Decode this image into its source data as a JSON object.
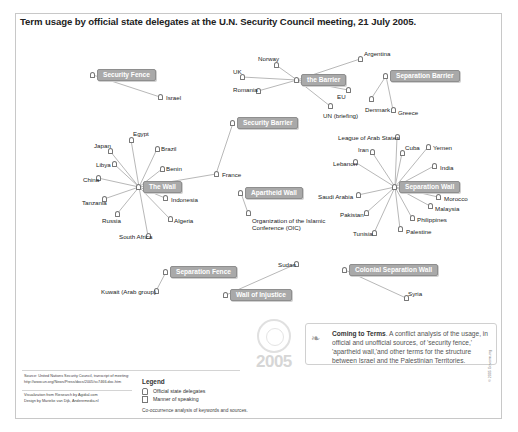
{
  "title": "Term usage by official state delegates at the U.N. Security Council meeting, 21 July 2005.",
  "chart_data": {
    "type": "network",
    "title": "Term usage by official state delegates at the U.N. Security Council meeting, 21 July 2005.",
    "terms": [
      {
        "term": "Security Fence",
        "delegates": [
          "Israel"
        ]
      },
      {
        "term": "the Barrier",
        "delegates": [
          "Norway",
          "UK",
          "Romania",
          "Argentina",
          "EU",
          "UN (briefing)"
        ]
      },
      {
        "term": "Separation Barrier",
        "delegates": [
          "Denmark",
          "Greece"
        ]
      },
      {
        "term": "Security Barrier",
        "delegates": [
          "France"
        ]
      },
      {
        "term": "The Wall",
        "delegates": [
          "Egypt",
          "Japan",
          "Brazil",
          "Libya",
          "Benin",
          "China",
          "France",
          "Tanzania",
          "Indonesia",
          "Russia",
          "Algeria",
          "South Africa"
        ]
      },
      {
        "term": "Apartheid Wall",
        "delegates": [
          "Organization of the Islamic Conference (OIC)"
        ]
      },
      {
        "term": "Separation Wall",
        "delegates": [
          "League of Arab States",
          "Iran",
          "Cuba",
          "Yemen",
          "Lebanon",
          "India",
          "Saudi Arabia",
          "Morocco",
          "Malaysia",
          "Pakistan",
          "Philippines",
          "Tunisia",
          "Palestine"
        ]
      },
      {
        "term": "Separation Fence",
        "delegates": [
          "Kuwait (Arab group)"
        ]
      },
      {
        "term": "Wall of Injustice",
        "delegates": [
          "Sudan"
        ]
      },
      {
        "term": "Colonial Separation Wall",
        "delegates": [
          "Syria"
        ]
      }
    ]
  },
  "hubs": [
    {
      "label": "Security Fence",
      "x": 97,
      "y": 69
    },
    {
      "label": "the Barrier",
      "x": 301,
      "y": 74
    },
    {
      "label": "Separation Barrier",
      "x": 390,
      "y": 70
    },
    {
      "label": "Security Barrier",
      "x": 237,
      "y": 117
    },
    {
      "label": "The Wall",
      "x": 143,
      "y": 181
    },
    {
      "label": "Apartheid Wall",
      "x": 245,
      "y": 187
    },
    {
      "label": "Separation Wall",
      "x": 399,
      "y": 181
    },
    {
      "label": "Separation Fence",
      "x": 170,
      "y": 266
    },
    {
      "label": "Wall of Injustice",
      "x": 230,
      "y": 289
    },
    {
      "label": "Colonial Separation Wall",
      "x": 349,
      "y": 264
    }
  ],
  "nodes": [
    {
      "label": "Israel",
      "x": 160,
      "y": 97,
      "lx": 166,
      "ly": 94
    },
    {
      "label": "Norway",
      "x": 276,
      "y": 65,
      "lx": 258,
      "ly": 55
    },
    {
      "label": "UK",
      "x": 242,
      "y": 77,
      "lx": 233,
      "ly": 68
    },
    {
      "label": "Romania",
      "x": 258,
      "y": 91,
      "lx": 233,
      "ly": 86
    },
    {
      "label": "Argentina",
      "x": 360,
      "y": 59,
      "lx": 364,
      "ly": 50
    },
    {
      "label": "EU",
      "x": 348,
      "y": 90,
      "lx": 337,
      "ly": 93
    },
    {
      "label": "UN (briefing)",
      "x": 330,
      "y": 106,
      "lx": 323,
      "ly": 112
    },
    {
      "label": "Denmark",
      "x": 371,
      "y": 99,
      "lx": 365,
      "ly": 106
    },
    {
      "label": "Greece",
      "x": 393,
      "y": 110,
      "lx": 398,
      "ly": 109
    },
    {
      "label": "France",
      "x": 216,
      "y": 174,
      "lx": 222,
      "ly": 171
    },
    {
      "label": "Egypt",
      "x": 131,
      "y": 140,
      "lx": 133,
      "ly": 130
    },
    {
      "label": "Japan",
      "x": 110,
      "y": 151,
      "lx": 94,
      "ly": 142
    },
    {
      "label": "Brazil",
      "x": 157,
      "y": 149,
      "lx": 161,
      "ly": 145
    },
    {
      "label": "Libya",
      "x": 114,
      "y": 164,
      "lx": 96,
      "ly": 161
    },
    {
      "label": "Benin",
      "x": 162,
      "y": 169,
      "lx": 166,
      "ly": 165
    },
    {
      "label": "China",
      "x": 98,
      "y": 178,
      "lx": 83,
      "ly": 176
    },
    {
      "label": "Tanzania",
      "x": 104,
      "y": 199,
      "lx": 82,
      "ly": 199
    },
    {
      "label": "Indonesia",
      "x": 165,
      "y": 198,
      "lx": 171,
      "ly": 196
    },
    {
      "label": "Russia",
      "x": 117,
      "y": 214,
      "lx": 102,
      "ly": 217
    },
    {
      "label": "Algeria",
      "x": 170,
      "y": 219,
      "lx": 174,
      "ly": 217
    },
    {
      "label": "South Africa",
      "x": 148,
      "y": 236,
      "lx": 119,
      "ly": 233
    },
    {
      "label": "Organization of the Islamic Conference (OIC)",
      "x": 248,
      "y": 213,
      "lx": 252,
      "ly": 217
    },
    {
      "label": "League of Arab States",
      "x": 397,
      "y": 137,
      "lx": 338,
      "ly": 134
    },
    {
      "label": "Iran",
      "x": 372,
      "y": 152,
      "lx": 358,
      "ly": 146
    },
    {
      "label": "Cuba",
      "x": 402,
      "y": 153,
      "lx": 405,
      "ly": 144
    },
    {
      "label": "Yemen",
      "x": 428,
      "y": 147,
      "lx": 433,
      "ly": 144
    },
    {
      "label": "Lebanon",
      "x": 355,
      "y": 162,
      "lx": 333,
      "ly": 160
    },
    {
      "label": "India",
      "x": 434,
      "y": 166,
      "lx": 440,
      "ly": 164
    },
    {
      "label": "Saudi Arabia",
      "x": 358,
      "y": 195,
      "lx": 318,
      "ly": 193
    },
    {
      "label": "Morocco",
      "x": 438,
      "y": 197,
      "lx": 444,
      "ly": 195
    },
    {
      "label": "Malaysia",
      "x": 430,
      "y": 206,
      "lx": 435,
      "ly": 205
    },
    {
      "label": "Pakistan",
      "x": 366,
      "y": 213,
      "lx": 340,
      "ly": 211
    },
    {
      "label": "Philippines",
      "x": 412,
      "y": 218,
      "lx": 417,
      "ly": 216
    },
    {
      "label": "Tunisia",
      "x": 374,
      "y": 233,
      "lx": 353,
      "ly": 230
    },
    {
      "label": "Palestine",
      "x": 400,
      "y": 229,
      "lx": 406,
      "ly": 228
    },
    {
      "label": "Kuwait (Arab group)",
      "x": 156,
      "y": 291,
      "lx": 101,
      "ly": 288
    },
    {
      "label": "Sudan",
      "x": 296,
      "y": 264,
      "lx": 278,
      "ly": 261
    },
    {
      "label": "Syria",
      "x": 406,
      "y": 298,
      "lx": 408,
      "ly": 290
    }
  ],
  "edges": [
    [
      "Security Fence",
      "Israel"
    ],
    [
      "the Barrier",
      "Norway"
    ],
    [
      "the Barrier",
      "UK"
    ],
    [
      "the Barrier",
      "Romania"
    ],
    [
      "the Barrier",
      "Argentina"
    ],
    [
      "the Barrier",
      "EU"
    ],
    [
      "the Barrier",
      "UN (briefing)"
    ],
    [
      "Separation Barrier",
      "Denmark"
    ],
    [
      "Separation Barrier",
      "Greece"
    ],
    [
      "Security Barrier",
      "France"
    ],
    [
      "The Wall",
      "Egypt"
    ],
    [
      "The Wall",
      "Japan"
    ],
    [
      "The Wall",
      "Brazil"
    ],
    [
      "The Wall",
      "Libya"
    ],
    [
      "The Wall",
      "Benin"
    ],
    [
      "The Wall",
      "China"
    ],
    [
      "The Wall",
      "France"
    ],
    [
      "The Wall",
      "Tanzania"
    ],
    [
      "The Wall",
      "Indonesia"
    ],
    [
      "The Wall",
      "Russia"
    ],
    [
      "The Wall",
      "Algeria"
    ],
    [
      "The Wall",
      "South Africa"
    ],
    [
      "Apartheid Wall",
      "Organization of the Islamic Conference (OIC)"
    ],
    [
      "Separation Wall",
      "League of Arab States"
    ],
    [
      "Separation Wall",
      "Iran"
    ],
    [
      "Separation Wall",
      "Cuba"
    ],
    [
      "Separation Wall",
      "Yemen"
    ],
    [
      "Separation Wall",
      "Lebanon"
    ],
    [
      "Separation Wall",
      "India"
    ],
    [
      "Separation Wall",
      "Saudi Arabia"
    ],
    [
      "Separation Wall",
      "Morocco"
    ],
    [
      "Separation Wall",
      "Malaysia"
    ],
    [
      "Separation Wall",
      "Pakistan"
    ],
    [
      "Separation Wall",
      "Philippines"
    ],
    [
      "Separation Wall",
      "Tunisia"
    ],
    [
      "Separation Wall",
      "Palestine"
    ],
    [
      "Separation Fence",
      "Kuwait (Arab group)"
    ],
    [
      "Wall of Injustice",
      "Sudan"
    ],
    [
      "Colonial Separation Wall",
      "Syria"
    ]
  ],
  "source": {
    "line1": "Source: United Nations Security Council, transcript of meeting:",
    "line2": "http://www.un.org/News/Press/docs/2005/sc7466.doc.htm",
    "line3": "Visualization from Riesearch by Agidial.com",
    "line4": "Design by Marieke van Dijk, Anderemedia.nl"
  },
  "legend": {
    "title": "Legend",
    "items": [
      "Official state delegates",
      "Manner of speaking"
    ],
    "note": "Co-occurrence analysis of keywords and sources."
  },
  "logo": {
    "year": "2005"
  },
  "info": {
    "heading": "Coming to Terms",
    "body": ". A conflict analysis of the usage, in official and unofficial sources, of 'security fence,' 'apartheid wall,'and other terms for the structure between Israel and the Palestinian Territories."
  },
  "copyright": "© 2005 Govcom.org",
  "colors": {
    "hub_fill": "#a9a9a9",
    "edge": "#b8b8b8",
    "text": "#222222"
  }
}
